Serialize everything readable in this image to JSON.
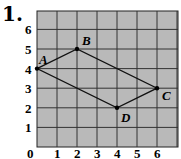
{
  "problem_number": "1.",
  "chart_data": {
    "type": "scatter",
    "title": "",
    "grid": true,
    "xlim": [
      0,
      7
    ],
    "ylim": [
      0,
      7
    ],
    "x_ticks": [
      "0",
      "1",
      "2",
      "3",
      "4",
      "5",
      "6"
    ],
    "y_ticks": [
      "1",
      "2",
      "3",
      "4",
      "5",
      "6"
    ],
    "points": [
      {
        "label": "A",
        "x": 0,
        "y": 4
      },
      {
        "label": "B",
        "x": 2,
        "y": 5
      },
      {
        "label": "C",
        "x": 6,
        "y": 3
      },
      {
        "label": "D",
        "x": 4,
        "y": 2
      }
    ],
    "polygon": [
      "A",
      "B",
      "C",
      "D"
    ],
    "colors": {
      "grid_bg": "#b8b8b8",
      "grid_line": "#222222",
      "shape": "#111111"
    }
  }
}
